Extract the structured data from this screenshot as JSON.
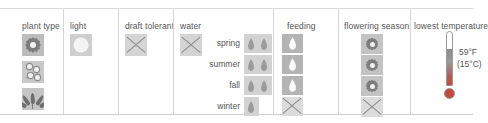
{
  "table": {
    "columns": [
      {
        "id": "plant-type",
        "header": "plant type",
        "icons": [
          "flower-icon",
          "buds-icon",
          "leafy-plant-icon"
        ]
      },
      {
        "id": "light",
        "header": "light",
        "icons": [
          "sun-icon"
        ]
      },
      {
        "id": "draft-tolerant",
        "header": "draft tolerant",
        "icons": [
          "x-mark-icon"
        ]
      },
      {
        "id": "water",
        "header": "water",
        "icons": [
          "x-mark-icon"
        ],
        "rows": [
          {
            "label": "spring",
            "drops": 2
          },
          {
            "label": "summer",
            "drops": 2
          },
          {
            "label": "fall",
            "drops": 2
          },
          {
            "label": "winter",
            "drops": 1
          }
        ]
      },
      {
        "id": "feeding",
        "header": "feeding",
        "rows": [
          {
            "icon": "drop-icon"
          },
          {
            "icon": "drop-icon"
          },
          {
            "icon": "drop-icon"
          },
          {
            "icon": "x-mark-icon"
          }
        ]
      },
      {
        "id": "flowering-season",
        "header": "flowering season",
        "rows": [
          {
            "icon": "flower-icon"
          },
          {
            "icon": "flower-icon"
          },
          {
            "icon": "flower-icon"
          },
          {
            "icon": "x-mark-icon"
          }
        ]
      },
      {
        "id": "lowest-temperature",
        "header": "lowest temperature",
        "icon": "thermometer-icon",
        "fahrenheit": "59°F",
        "celsius": "(15°C)"
      }
    ]
  },
  "colors": {
    "border": "#d6d6d6",
    "tile": "#bdbdbd",
    "glyph": "#7d7d7d",
    "mercury": "#c24a3e",
    "text": "#555555"
  }
}
